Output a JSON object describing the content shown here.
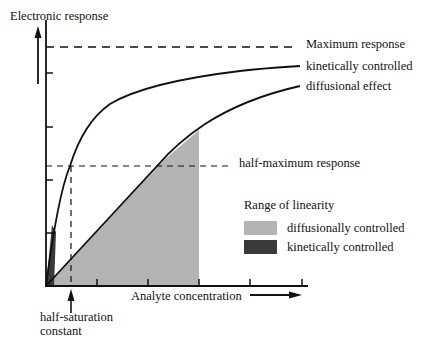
{
  "diagram": {
    "y_axis_label": "Electronic response",
    "x_axis_label": "Analyte concentration",
    "curves": [
      {
        "name": "kinetically controlled",
        "label": "kinetically controlled"
      },
      {
        "name": "diffusional effect",
        "label": "diffusional effect"
      }
    ],
    "reference_lines": {
      "maximum": "Maximum response",
      "half_maximum": "half-maximum response",
      "half_saturation_line1": "half-saturation",
      "half_saturation_line2": "constant"
    },
    "legend": {
      "title": "Range of linearity",
      "items": [
        {
          "label": "diffusionally controlled",
          "color": "#b4b4b4"
        },
        {
          "label": "kinetically controlled",
          "color": "#3a3a3a"
        }
      ]
    },
    "colors": {
      "line": "#111111",
      "diffusional_fill": "#b4b4b4",
      "kinetic_fill": "#3a3a3a"
    }
  }
}
